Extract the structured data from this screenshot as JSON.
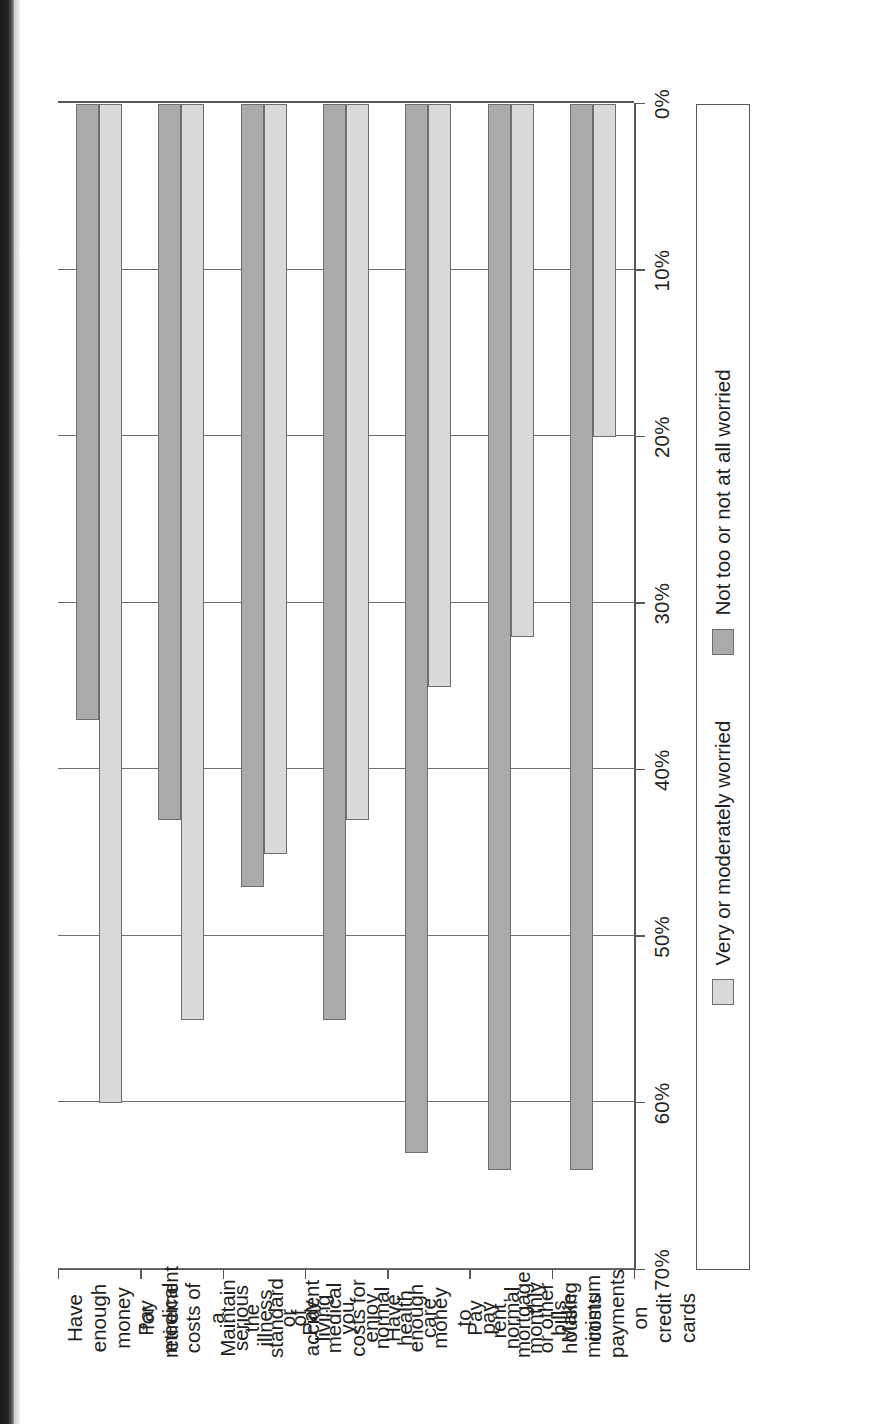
{
  "chart_data": {
    "type": "bar",
    "orientation": "horizontal",
    "title": "",
    "subtitle": "",
    "xlabel": "",
    "ylabel": "",
    "xlim": [
      0,
      70
    ],
    "xticks": [
      "0%",
      "10%",
      "20%",
      "30%",
      "40%",
      "50%",
      "60%",
      "70%"
    ],
    "xtick_values": [
      0,
      10,
      20,
      30,
      40,
      50,
      60,
      70
    ],
    "grid": true,
    "legend_position": "bottom",
    "categories": [
      "Have enough money for retirement",
      "Pay medical costs of a serious illness or accident",
      "Maintain the standard of living you enjoy",
      "Pay medical costs for normal health care",
      "Have enough money to pay normal monthly bills",
      "Pay rent, mortgage or other housing costs",
      "Make minimum payments on credit cards"
    ],
    "category_lines": [
      [
        "Have enough",
        "money for",
        "retirement"
      ],
      [
        "Pay medical",
        "costs of a",
        "serious illness",
        "or accident"
      ],
      [
        "Maintain the",
        "standard of",
        "living you",
        "enjoy"
      ],
      [
        "Pay medical",
        "costs for",
        "normal health",
        "care"
      ],
      [
        "Have enough",
        "money to",
        "pay normal",
        "monthly bills"
      ],
      [
        "Pay rent,",
        "mortgage",
        "or other housing",
        "costs"
      ],
      [
        "Make minimum",
        "payments on",
        "credit cards"
      ]
    ],
    "series": [
      {
        "name": "Very or moderately worried",
        "color": "#d9d9d9",
        "values": [
          60,
          55,
          45,
          43,
          35,
          32,
          20
        ]
      },
      {
        "name": "Not too or not at all worried",
        "color": "#aaaaaa",
        "values": [
          37,
          43,
          47,
          55,
          63,
          64,
          64
        ]
      }
    ]
  },
  "legend": {
    "items": [
      {
        "label": "Very or moderately worried",
        "style": "s-light"
      },
      {
        "label": "Not too or not at all worried",
        "style": "s-dark"
      }
    ]
  }
}
